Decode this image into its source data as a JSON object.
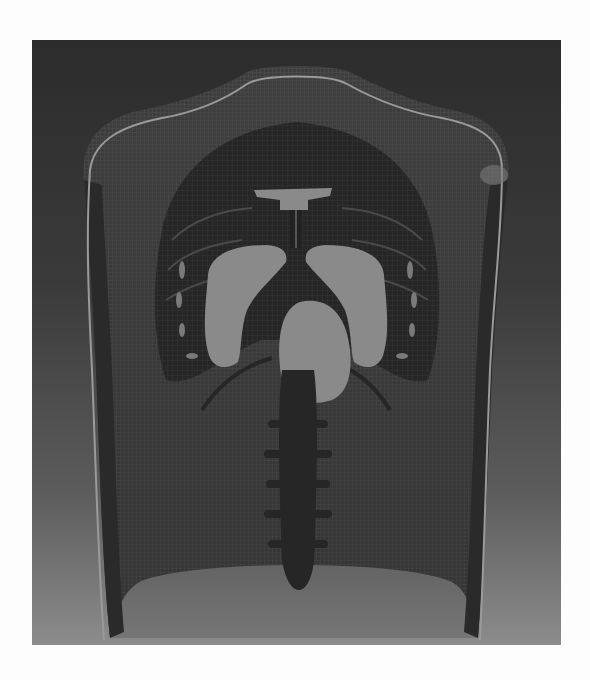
{
  "figure": {
    "colors": {
      "page_background": "#fdfdfd",
      "panel_top": "#2c2c2c",
      "panel_bottom": "#8c8c8c",
      "skin_mesh": "#3f3f3f",
      "skin_outline": "#9a9a9a",
      "organs": "#8a8a8a",
      "ribs_lungs_dark": "#262626",
      "spine": "#2a2a2a"
    },
    "parts": [
      "torso-shell",
      "shoulders",
      "rib-cage",
      "lungs",
      "heart",
      "trachea",
      "clavicle",
      "diaphragm",
      "spine"
    ]
  }
}
